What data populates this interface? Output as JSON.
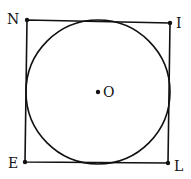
{
  "diagram": {
    "title": "",
    "points": {
      "N": {
        "label": "N",
        "x": 27,
        "y": 20
      },
      "I": {
        "label": "I",
        "x": 170,
        "y": 23
      },
      "E": {
        "label": "E",
        "x": 25,
        "y": 162
      },
      "L": {
        "label": "L",
        "x": 168,
        "y": 163
      },
      "O": {
        "label": "O",
        "x": 98,
        "y": 92
      }
    },
    "shapes": [
      {
        "type": "quadrilateral",
        "vertices": [
          "N",
          "I",
          "L",
          "E"
        ]
      },
      {
        "type": "circle",
        "center": "O",
        "radius": 72,
        "inscribed_in": "NILE"
      }
    ],
    "colors": {
      "stroke": "#111111",
      "background": "#ffffff"
    }
  }
}
